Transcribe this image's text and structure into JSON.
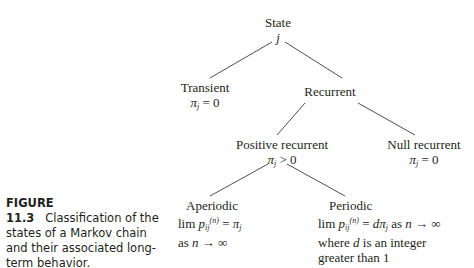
{
  "diagram": {
    "type": "tree",
    "nodes": {
      "root": {
        "title": "State",
        "line2": "j"
      },
      "transient": {
        "title": "Transient",
        "condition": "π_j = 0"
      },
      "recurrent": {
        "title": "Recurrent"
      },
      "positive_recurrent": {
        "title": "Positive recurrent",
        "condition": "π_j > 0"
      },
      "null_recurrent": {
        "title": "Null recurrent",
        "condition": "π_j = 0"
      },
      "aperiodic": {
        "title": "Aperiodic",
        "line2": "lim p_ij^(n) = π_j",
        "line3": "as n → ∞"
      },
      "periodic": {
        "title": "Periodic",
        "line2": "lim p_ij^(n) = dπ_j as n → ∞",
        "line3": "where d is an integer",
        "line4": "greater than 1"
      }
    },
    "edges": [
      [
        "root",
        "transient"
      ],
      [
        "root",
        "recurrent"
      ],
      [
        "recurrent",
        "positive_recurrent"
      ],
      [
        "recurrent",
        "null_recurrent"
      ],
      [
        "positive_recurrent",
        "aperiodic"
      ],
      [
        "positive_recurrent",
        "periodic"
      ]
    ]
  },
  "caption": {
    "label": "FIGURE 11.3",
    "text": "Classification of the states of a Markov chain and their associated long-term behavior."
  },
  "glyphs": {
    "pi": "π",
    "j": "j",
    "ij": "ij",
    "n": "n",
    "sup_n": "(n)",
    "lim": "lim",
    "p": "p",
    "d": "d",
    "eq0": " = 0",
    "gt0": " > 0",
    "eq": " = ",
    "as": "as ",
    "arrow_inf": " → ∞",
    "as_n_sep": " as ",
    "where": "where ",
    "is_int": " is an integer"
  }
}
